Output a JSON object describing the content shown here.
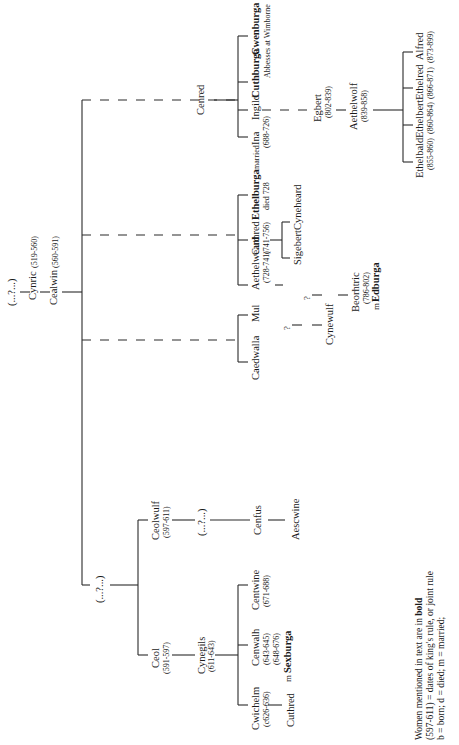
{
  "nodes": {
    "unknown_root": "(...?...)",
    "cynric": "Cynric",
    "cynric_dates": "(519-560)",
    "cealwin": "Cealwin",
    "cealwin_dates": "(560-591)",
    "unknown_branch": "(...?...)",
    "ceol": "Ceol",
    "ceol_dates": "(591-597)",
    "ceolwulf": "Ceolwulf",
    "ceolwulf_dates": "(597-611)",
    "cynegils": "Cynegils",
    "cynegils_dates": "(611-643)",
    "unknown_ceolwulf": "(...?...)",
    "cwichelm": "Cwichelm",
    "cwichelm_dates": "(c626-636)",
    "cenwalh": "Cenwalh",
    "cenwalh_dates1": "(643-645)",
    "cenwalh_dates2": "(648-676)",
    "cenwalh_married": "m",
    "sexburga": "Sexburga",
    "centwine": "Centwine",
    "centwine_dates": "(671-688)",
    "cenfus": "Cenfus",
    "aescwine": "Aescwine",
    "cuthred_early": "Cuthred",
    "caedwalla": "Caedwalla",
    "mul": "Mul",
    "q1": "?",
    "q2": "?",
    "cynewulf": "Cynewulf",
    "beorhtric": "Beorhtric",
    "beorhtric_dates": "(786-802)",
    "beorhtric_married": "m",
    "edburga": "Edburga",
    "aethelweard": "Aethelweard",
    "aethelweard_dates": "(728-741)",
    "cuthred": "Cuthred",
    "cuthred_dates": "(741-756)",
    "ethelburga": "Ethelburga",
    "ethelburga_note": "died 728",
    "sigebert": "Sigebert",
    "cyneheard": "Cyneheard",
    "cenred": "Cenred",
    "married_note": "married",
    "ina": "Ina",
    "ina_dates": "(688-726)",
    "ingild": "Ingild",
    "cuthburga": "Cuthburga",
    "cwenburga": "Cwenburga",
    "abbesses_note": "Abbesses at Wimborne",
    "egbert": "Egbert",
    "egbert_dates": "(802-839)",
    "aethelwolf": "Aethelwolf",
    "aethelwolf_dates": "(839-858)",
    "ethelbald": "Ethelbald",
    "ethelbald_dates": "(855-860)",
    "ethelbert": "Ethelbert",
    "ethelbert_dates": "(860-864)",
    "ethelred": "Ethelred",
    "ethelred_dates": "(866-871)",
    "alfred": "Alfred",
    "alfred_dates": "(873-899)"
  },
  "legend": {
    "line1_prefix": "Women mentioned in text  are in ",
    "line1_bold": "bold",
    "line2": "(597-611) = dates of king's rule, or joint rule",
    "line3": "b = born;  d = died;  m = married;"
  }
}
